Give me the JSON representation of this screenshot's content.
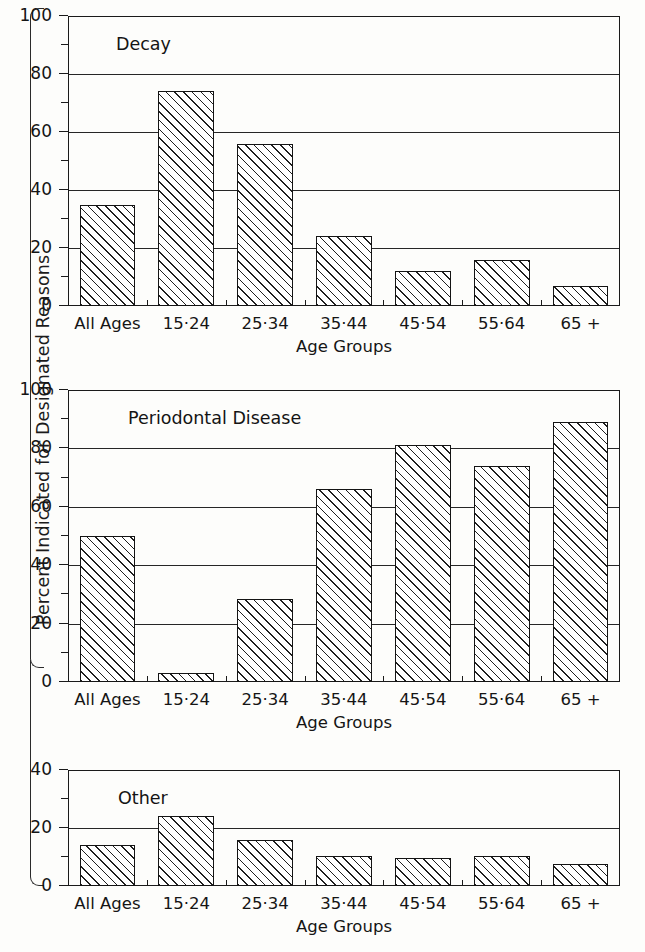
{
  "figure": {
    "ylabel": "Percent Indicated for Designated Reasons",
    "xlabel": "Age Groups"
  },
  "categories": [
    "All Ages",
    "15·24",
    "25·34",
    "35·44",
    "45·54",
    "55·64",
    "65 +"
  ],
  "panels": [
    {
      "title": "Decay",
      "ylim": [
        0,
        100
      ],
      "yticks_major": [
        "0",
        "20",
        "40",
        "60",
        "80",
        "100"
      ],
      "yticks_minor": [
        10,
        30,
        50,
        70,
        90
      ],
      "values": [
        35,
        74,
        56,
        24,
        12,
        16,
        7
      ]
    },
    {
      "title": "Periodontal Disease",
      "ylim": [
        0,
        100
      ],
      "yticks_major": [
        "0",
        "20",
        "40",
        "60",
        "80",
        "100"
      ],
      "yticks_minor": [
        10,
        30,
        50,
        70,
        90
      ],
      "values": [
        50,
        3,
        28.5,
        66,
        81,
        74,
        89
      ]
    },
    {
      "title": "Other",
      "ylim": [
        0,
        40
      ],
      "yticks_major": [
        "0",
        "20",
        "40"
      ],
      "yticks_minor": [
        10,
        30
      ],
      "values": [
        14,
        24,
        16,
        10.5,
        9.5,
        10.5,
        7.5
      ]
    }
  ],
  "chart_data": {
    "type": "bar",
    "title": "",
    "xlabel": "Age Groups",
    "ylabel": "Percent Indicated for Designated Reasons",
    "categories": [
      "All Ages",
      "15-24",
      "25-34",
      "35-44",
      "45-54",
      "55-64",
      "65 +"
    ],
    "panels": [
      {
        "name": "Decay",
        "ylim": [
          0,
          100
        ],
        "yticks": [
          0,
          20,
          40,
          60,
          80,
          100
        ],
        "minor_yticks": [
          10,
          30,
          50,
          70,
          90
        ],
        "grid": "horizontal",
        "values": [
          35,
          74,
          56,
          24,
          12,
          16,
          7
        ]
      },
      {
        "name": "Periodontal Disease",
        "ylim": [
          0,
          100
        ],
        "yticks": [
          0,
          20,
          40,
          60,
          80,
          100
        ],
        "minor_yticks": [
          10,
          30,
          50,
          70,
          90
        ],
        "grid": "horizontal",
        "values": [
          50,
          3,
          28.5,
          66,
          81,
          74,
          89
        ]
      },
      {
        "name": "Other",
        "ylim": [
          0,
          40
        ],
        "yticks": [
          0,
          20,
          40
        ],
        "minor_yticks": [
          10,
          30
        ],
        "grid": "horizontal",
        "values": [
          14,
          24,
          16,
          10.5,
          9.5,
          10.5,
          7.5
        ]
      }
    ],
    "legend": [],
    "series_style": "hatched-diagonal-bars",
    "colors": {
      "bar_edge": "#141414",
      "bar_fill": "#ffffff",
      "hatch": "#1f1f1f",
      "axis": "#1a1a1a"
    }
  }
}
